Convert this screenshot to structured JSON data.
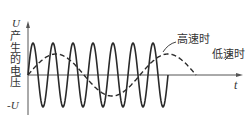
{
  "figure": {
    "y_axis_top_label": "U",
    "y_axis_bottom_label": "-U",
    "y_axis_caption_chars": [
      "产",
      "生",
      "的",
      "电",
      "压"
    ],
    "x_axis_label": "t",
    "annotations": {
      "high_speed": "高速时",
      "low_speed": "低速时"
    },
    "colors": {
      "line": "#2a2a2a",
      "axis": "#555555",
      "text": "#333333"
    }
  },
  "chart_data": {
    "type": "line",
    "title": "",
    "xlabel": "t",
    "ylabel": "产生的电压",
    "ylim": [
      "-U",
      "U"
    ],
    "series": [
      {
        "name": "高速时",
        "style": "solid",
        "amplitude": "U",
        "cycles": 7,
        "description": "high-frequency sinusoid starting at 0, ends after ~7 periods"
      },
      {
        "name": "低速时",
        "style": "dashed",
        "amplitude": "0.6U",
        "cycles": 1.5,
        "description": "low-frequency sinusoid starting at 0, ~1.5 periods"
      }
    ],
    "grid": false
  }
}
